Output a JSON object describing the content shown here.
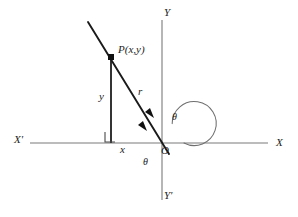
{
  "figure": {
    "type": "geometry-diagram",
    "width": 298,
    "height": 217,
    "background_color": "#ffffff",
    "line_color": "#6f6f6f",
    "ray_color": "#1a1a1a",
    "text_color": "#222222"
  },
  "labels": {
    "axis_y_positive": "Y",
    "axis_y_negative": "Y'",
    "axis_x_positive": "X",
    "axis_x_negative": "X'",
    "point_p": "P(x,y)",
    "side_y": "y",
    "side_r": "r",
    "side_x": "x",
    "origin": "O",
    "theta_upper": "θ",
    "theta_lower": "θ"
  },
  "geometry": {
    "origin": {
      "x": 162,
      "y": 143
    },
    "point_p": {
      "x": 111,
      "y": 57
    },
    "ray_start": {
      "x": 88,
      "y": 22
    },
    "ray_end": {
      "x": 168,
      "y": 153
    },
    "x_axis": {
      "x1": 30,
      "y1": 143,
      "x2": 268,
      "y2": 143
    },
    "y_axis": {
      "x1": 162,
      "y1": 20,
      "x2": 162,
      "y2": 200
    },
    "foot": {
      "x": 111,
      "y": 143
    },
    "arc_radius": 22,
    "right_angle_size": 10
  },
  "annotations": {
    "arrowheads": [
      {
        "name": "arrowhead-upper-on-ray",
        "x": 151,
        "y": 113
      },
      {
        "name": "arrowhead-lower-on-ray",
        "x": 143,
        "y": 126
      }
    ]
  }
}
